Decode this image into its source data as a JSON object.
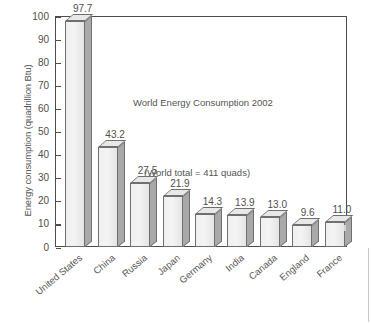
{
  "chart_data": {
    "type": "bar",
    "title": "World Energy Consumption 2002",
    "annotation": "(World total = 411 quads)",
    "xlabel": "",
    "ylabel": "Energy consumption (quadrillion Btu)",
    "ylim": [
      0,
      100
    ],
    "yticks": [
      0,
      10,
      20,
      30,
      40,
      50,
      60,
      70,
      80,
      90,
      100
    ],
    "ytick_labels": [
      "0",
      "10",
      "20",
      "30",
      "40",
      "50",
      "60",
      "70",
      "80",
      "90",
      "100"
    ],
    "grid": false,
    "legend": false,
    "categories": [
      "United States",
      "China",
      "Russia",
      "Japan",
      "Germany",
      "India",
      "Canada",
      "England",
      "France"
    ],
    "values": [
      97.7,
      43.2,
      27.5,
      21.9,
      14.3,
      13.9,
      13.0,
      9.6,
      11.0
    ],
    "value_labels": [
      "97.7",
      "43.2",
      "27.5",
      "21.9",
      "14.3",
      "13.9",
      "13.0",
      "9.6",
      "11.0"
    ],
    "style": {
      "bar_face_color": "#efefef",
      "bar_side_color": "#a9a9a9",
      "bar_top_color": "#e8e8e8",
      "bar_edge_color": "#6f6f6f",
      "axis_color": "#4d4d4d",
      "text_color": "#4f4f4f",
      "background_color": "#ffffff",
      "three_d": true
    }
  }
}
